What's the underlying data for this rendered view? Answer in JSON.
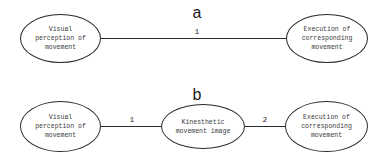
{
  "diagram_a": {
    "label": "a",
    "nodes": [
      {
        "id": "visual-perception",
        "text": "Visual\nperception of\nmovement"
      },
      {
        "id": "execution",
        "text": "Execution of\ncorresponding\nmovement"
      }
    ],
    "edges": [
      {
        "from": "visual-perception",
        "to": "execution",
        "label": "1"
      }
    ]
  },
  "diagram_b": {
    "label": "b",
    "nodes": [
      {
        "id": "visual-perception",
        "text": "Visual\nperception of\nmovement"
      },
      {
        "id": "kinesthetic-image",
        "text": "Kinesthetic\nmovement image"
      },
      {
        "id": "execution",
        "text": "Execution of\ncorresponding\nmovement"
      }
    ],
    "edges": [
      {
        "from": "visual-perception",
        "to": "kinesthetic-image",
        "label": "1"
      },
      {
        "from": "kinesthetic-image",
        "to": "execution",
        "label": "2"
      }
    ]
  }
}
